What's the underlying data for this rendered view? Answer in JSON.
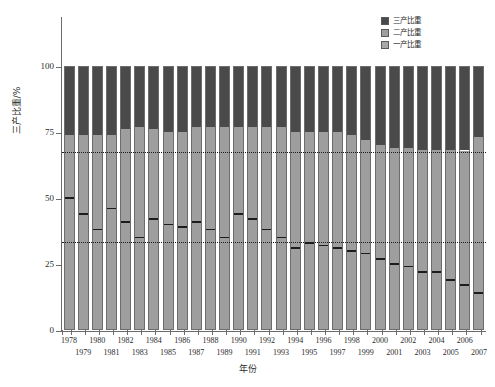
{
  "chart_data": {
    "type": "bar",
    "subtype": "stacked-percentage",
    "title": "",
    "xlabel": "年份",
    "ylabel": "三产比重/%",
    "ylim": [
      0,
      100
    ],
    "yticks": [
      0,
      25,
      50,
      75,
      100
    ],
    "grid": false,
    "legend_position": "top-right",
    "categories": [
      "1978",
      "1979",
      "1980",
      "1981",
      "1982",
      "1983",
      "1984",
      "1985",
      "1986",
      "1987",
      "1988",
      "1989",
      "1990",
      "1991",
      "1992",
      "1993",
      "1994",
      "1995",
      "1996",
      "1997",
      "1998",
      "1999",
      "2000",
      "2001",
      "2002",
      "2003",
      "2004",
      "2005",
      "2006",
      "2007"
    ],
    "series": [
      {
        "name": "一产比重",
        "color": "#9e9e9e",
        "values": [
          50,
          44,
          38,
          46,
          41,
          35,
          42,
          40,
          39,
          41,
          38,
          35,
          44,
          42,
          38,
          35,
          31,
          33,
          32,
          31,
          30,
          29,
          27,
          25,
          24,
          22,
          22,
          19,
          17,
          14
        ]
      },
      {
        "name": "二产比重",
        "color": "#9e9e9e",
        "values": [
          24,
          30,
          36,
          28,
          35,
          42,
          34,
          35,
          36,
          36,
          39,
          42,
          33,
          35,
          39,
          42,
          44,
          42,
          43,
          44,
          44,
          43,
          43,
          44,
          45,
          46,
          46,
          49,
          51,
          59
        ]
      },
      {
        "name": "三产比重",
        "color": "#4a4a4a",
        "values": [
          26,
          26,
          26,
          26,
          24,
          23,
          24,
          25,
          25,
          23,
          23,
          23,
          23,
          23,
          23,
          23,
          25,
          25,
          25,
          25,
          26,
          28,
          30,
          31,
          31,
          32,
          32,
          32,
          32,
          27
        ]
      }
    ],
    "reference_lines": [
      {
        "name": "upper-reference",
        "value": 67,
        "style": "dotted"
      },
      {
        "name": "lower-reference",
        "value": 33,
        "style": "dotted"
      }
    ]
  },
  "axes": {
    "y_title": "三产比重/%",
    "x_title": "年份",
    "y_tick_labels": [
      "0",
      "25",
      "50",
      "75",
      "100"
    ]
  },
  "legend": {
    "items": [
      {
        "label": "三产比重",
        "color": "#4a4a4a"
      },
      {
        "label": "二产比重",
        "color": "#9e9e9e"
      },
      {
        "label": "一产比重",
        "color": "#a8a8a8"
      }
    ]
  }
}
